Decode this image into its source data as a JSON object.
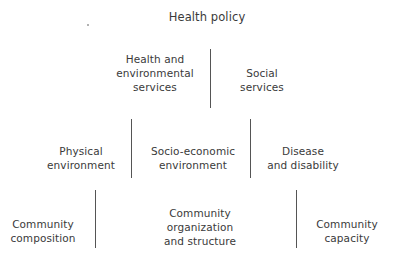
{
  "diagram": {
    "title": "Health policy",
    "level1": [
      {
        "label": "Health and\nenvironmental\nservices"
      },
      {
        "label": "Social\nservices"
      }
    ],
    "level2": [
      {
        "label": "Physical\nenvironment"
      },
      {
        "label": "Socio-economic\nenvironment"
      },
      {
        "label": "Disease\nand disability"
      }
    ],
    "level3": [
      {
        "label": "Community\ncomposition"
      },
      {
        "label": "Community\norganization\nand structure"
      },
      {
        "label": "Community\ncapacity"
      }
    ],
    "colors": {
      "text": "#3a3a3a",
      "divider": "#555555",
      "background": "#ffffff"
    }
  }
}
